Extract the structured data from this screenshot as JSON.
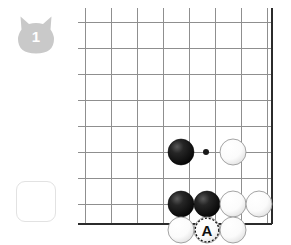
{
  "diagram": {
    "problem_number": "1",
    "badge_icon": "cat-head-badge-icon",
    "badge_color": "#c9c9c9",
    "answer_slot_label": "",
    "answer_slot_border_color": "#e2e2e2"
  },
  "board": {
    "line_color": "#8f8f8f",
    "edge_color": "#2b2b2b",
    "background_color": "#ffffff",
    "columns": 8,
    "rows": 8,
    "cell_size": 26,
    "origin_x": 85,
    "origin_y": 22,
    "right_edge_x": 272,
    "bottom_edge_y": 224,
    "star_points": [
      {
        "name": "hoshi-top-right",
        "x": 206,
        "y": 152,
        "radius": 3
      }
    ]
  },
  "stones": [
    {
      "id": "black-1",
      "color": "black",
      "x": 181,
      "y": 152,
      "radius": 13,
      "label": "",
      "marked": false
    },
    {
      "id": "white-1",
      "color": "white",
      "x": 233,
      "y": 152,
      "radius": 13,
      "label": "",
      "marked": false
    },
    {
      "id": "black-2",
      "color": "black",
      "x": 181,
      "y": 204,
      "radius": 13,
      "label": "",
      "marked": false
    },
    {
      "id": "black-3",
      "color": "black",
      "x": 207,
      "y": 204,
      "radius": 13,
      "label": "",
      "marked": false
    },
    {
      "id": "white-2",
      "color": "white",
      "x": 233,
      "y": 204,
      "radius": 13,
      "label": "",
      "marked": false
    },
    {
      "id": "white-3",
      "color": "white",
      "x": 259,
      "y": 204,
      "radius": 13,
      "label": "",
      "marked": false
    },
    {
      "id": "white-4",
      "color": "white",
      "x": 207,
      "y": 230,
      "radius": 13,
      "label": "A",
      "marked": true
    },
    {
      "id": "white-5",
      "color": "white",
      "x": 181,
      "y": 230,
      "radius": 13,
      "label": "",
      "marked": false
    },
    {
      "id": "white-6",
      "color": "white",
      "x": 233,
      "y": 230,
      "radius": 13,
      "label": "",
      "marked": false
    }
  ],
  "legend": {
    "marked_point_label": "A"
  }
}
